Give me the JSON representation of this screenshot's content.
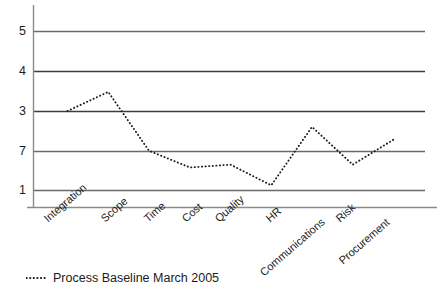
{
  "chart_data": {
    "type": "line",
    "title": "",
    "subtitle": "",
    "xlabel": "",
    "ylabel": "",
    "categories": [
      "Integration",
      "Scope",
      "Time",
      "Cost",
      "Quality",
      "HR",
      "Communications",
      "Risk",
      "Procurement"
    ],
    "series": [
      {
        "name": "Process Baseline March 2005",
        "values": [
          3.0,
          3.48,
          2.0,
          1.58,
          1.65,
          1.13,
          2.6,
          1.65,
          2.28
        ],
        "line_style": "dotted",
        "color": "#1a1a1a"
      }
    ],
    "ylim": [
      1,
      5
    ],
    "yticks": [
      1,
      2,
      3,
      4,
      5
    ],
    "ytick_labels": [
      "1",
      "7",
      "3",
      "4",
      "5"
    ],
    "grid": true,
    "grid_axis": "y",
    "grid_color": "#5a5a5a",
    "legend_position": "below-left",
    "axis_color": "#6e6e6e",
    "background": "#ffffff"
  },
  "legend": {
    "label": "Process Baseline March 2005",
    "marker": "dotted-line-marker"
  },
  "axes": {
    "y_axis_name": "value-axis",
    "x_axis_name": "category-axis"
  }
}
